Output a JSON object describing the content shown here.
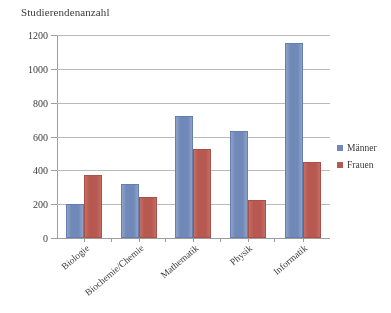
{
  "chart_data": {
    "type": "bar",
    "title": "Studierendenanzahl",
    "xlabel": "",
    "ylabel": "",
    "ylim": [
      0,
      1200
    ],
    "yticks": [
      0,
      200,
      400,
      600,
      800,
      1000,
      1200
    ],
    "grid": true,
    "legend_position": "right",
    "categories": [
      "Biologie",
      "Biochemie/Chemie",
      "Mathematik",
      "Physik",
      "Informatik"
    ],
    "series": [
      {
        "name": "Männer",
        "color": "#6b85b8",
        "values": [
          200,
          320,
          720,
          630,
          1150
        ]
      },
      {
        "name": "Frauen",
        "color": "#b5534a",
        "values": [
          370,
          240,
          525,
          225,
          450
        ]
      }
    ]
  },
  "axis": {
    "tick_labels": [
      "1200",
      "1000",
      "800",
      "600",
      "400",
      "200",
      "0"
    ]
  },
  "legend": {
    "entries": [
      {
        "label": "Männer",
        "color": "#6b85b8"
      },
      {
        "label": "Frauen",
        "color": "#b5534a"
      }
    ]
  }
}
